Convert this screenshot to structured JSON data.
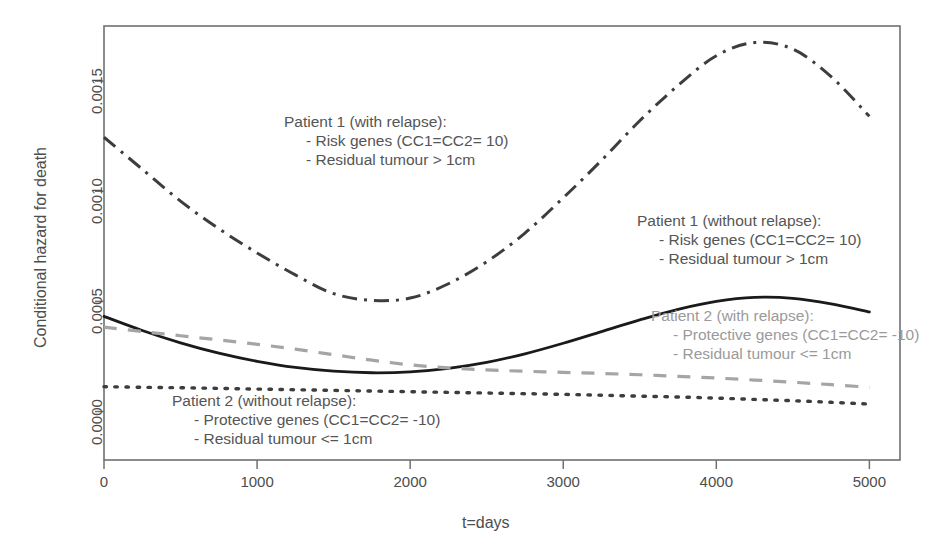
{
  "chart_data": {
    "type": "line",
    "title": "",
    "xlabel": "t=days",
    "ylabel": "Conditional hazard for death",
    "xlim": [
      0,
      5200
    ],
    "ylim": [
      -0.00022,
      0.00175
    ],
    "xticks": [
      0,
      1000,
      2000,
      3000,
      4000,
      5000
    ],
    "xticklabels": [
      "0",
      "1000",
      "2000",
      "3000",
      "4000",
      "5000"
    ],
    "yticks": [
      0.0,
      0.0005,
      0.001,
      0.0015
    ],
    "yticklabels": [
      "0.0000",
      "0.0005",
      "0.0010",
      "0.0015"
    ],
    "grid": false,
    "legend_position": "inline-annotations",
    "series": [
      {
        "name": "Patient 1 (with relapse)",
        "style": "dash-dot",
        "color": "#3d3d3d",
        "x": [
          0,
          250,
          500,
          750,
          1000,
          1250,
          1500,
          1750,
          2000,
          2250,
          2500,
          2750,
          3000,
          3250,
          3500,
          3750,
          4000,
          4250,
          4500,
          4750,
          5000
        ],
        "y": [
          0.001245,
          0.0011,
          0.000955,
          0.00083,
          0.00072,
          0.00062,
          0.000535,
          0.000505,
          0.000515,
          0.00058,
          0.00068,
          0.00081,
          0.00097,
          0.00114,
          0.00132,
          0.00148,
          0.001615,
          0.001675,
          0.001645,
          0.00152,
          0.00134
        ]
      },
      {
        "name": "Patient 1 (without relapse)",
        "style": "solid",
        "color": "#1a1a1a",
        "x": [
          0,
          250,
          500,
          750,
          1000,
          1250,
          1500,
          1750,
          2000,
          2250,
          2500,
          2750,
          3000,
          3250,
          3500,
          3750,
          4000,
          4250,
          4500,
          4750,
          5000
        ],
        "y": [
          0.000432,
          0.000368,
          0.000312,
          0.000265,
          0.000228,
          0.0002,
          0.000183,
          0.000176,
          0.00018,
          0.000196,
          0.000223,
          0.000262,
          0.00031,
          0.000363,
          0.000416,
          0.000464,
          0.0005,
          0.000518,
          0.000514,
          0.000489,
          0.000452
        ]
      },
      {
        "name": "Patient 2 (with relapse)",
        "style": "dashed",
        "color": "#a5a5a5",
        "x": [
          0,
          250,
          500,
          750,
          1000,
          1250,
          1500,
          1750,
          2000,
          2250,
          2500,
          2750,
          3000,
          3250,
          3500,
          3750,
          4000,
          4250,
          4500,
          4750,
          5000
        ],
        "y": [
          0.000383,
          0.000363,
          0.000344,
          0.000325,
          0.000305,
          0.000283,
          0.000258,
          0.000233,
          0.000212,
          0.000198,
          0.000189,
          0.000183,
          0.000178,
          0.000173,
          0.000167,
          0.00016,
          0.000152,
          0.000143,
          0.000133,
          0.000122,
          0.00011
        ]
      },
      {
        "name": "Patient 2 (without relapse)",
        "style": "dotted",
        "color": "#3d3d3d",
        "x": [
          0,
          250,
          500,
          750,
          1000,
          1250,
          1500,
          1750,
          2000,
          2250,
          2500,
          2750,
          3000,
          3250,
          3500,
          3750,
          4000,
          4250,
          4500,
          4750,
          5000
        ],
        "y": [
          0.000113,
          0.00011,
          0.000108,
          0.000105,
          0.000102,
          9.9e-05,
          9.6e-05,
          9.3e-05,
          9e-05,
          8.7e-05,
          8.4e-05,
          8.1e-05,
          7.8e-05,
          7.4e-05,
          7e-05,
          6.6e-05,
          6.1e-05,
          5.5e-05,
          4.9e-05,
          4.2e-05,
          3.4e-05
        ]
      }
    ],
    "annotations": [
      {
        "id": "patient1-with-relapse",
        "line1": "Patient 1 (with relapse):",
        "line2": "- Risk genes (CC1=CC2= 10)",
        "line3": "- Residual tumour > 1cm",
        "color": "#555555",
        "x": 284,
        "y": 112
      },
      {
        "id": "patient1-without-relapse",
        "line1": "Patient 1 (without relapse):",
        "line2": "- Risk genes (CC1=CC2= 10)",
        "line3": "- Residual tumour > 1cm",
        "color": "#555555",
        "x": 637,
        "y": 211
      },
      {
        "id": "patient2-with-relapse",
        "line1": "Patient 2 (with relapse):",
        "line2": "- Protective genes (CC1=CC2= -10)",
        "line3": "- Residual tumour <= 1cm",
        "color": "#9a9a9a",
        "x": 651,
        "y": 306
      },
      {
        "id": "patient2-without-relapse",
        "line1": "Patient 2 (without relapse):",
        "line2": "- Protective genes (CC1=CC2= -10)",
        "line3": "- Residual tumour <= 1cm",
        "color": "#555555",
        "x": 172,
        "y": 391
      }
    ]
  }
}
